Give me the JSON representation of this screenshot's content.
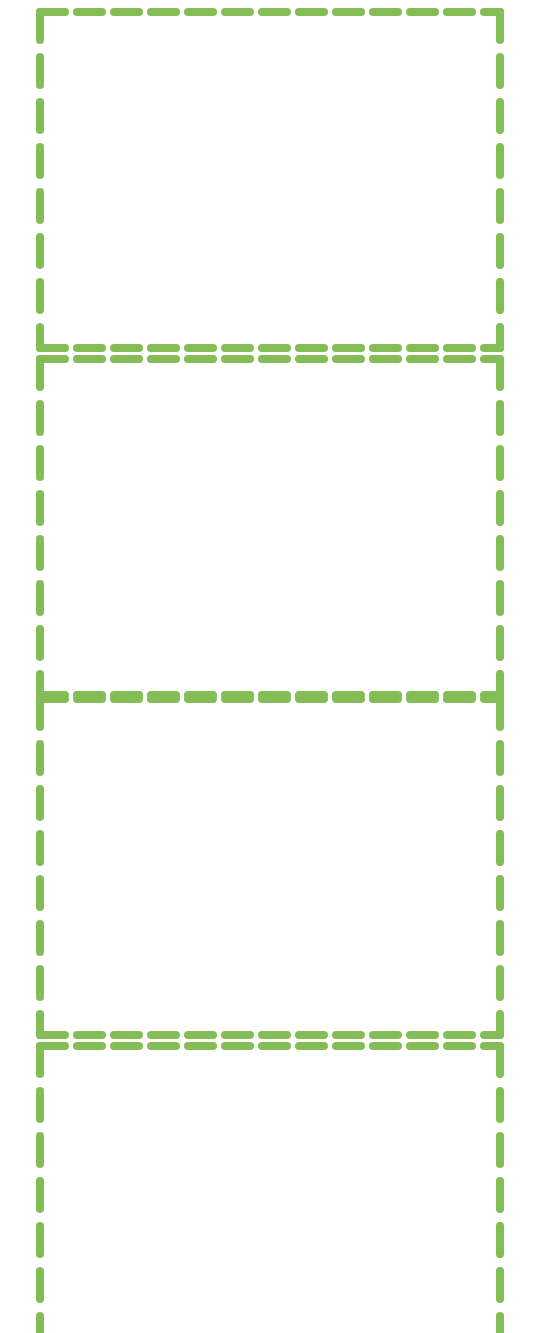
{
  "canvas": {
    "width": 544,
    "height": 1333,
    "background_color": "#ffffff",
    "label": "dashed-region-overlay"
  },
  "style": {
    "stroke_color": "#84bd55",
    "stroke_color_alt": "#7cb342",
    "stroke_width": 8,
    "dash_length_horizontal": 25,
    "dash_gap_horizontal": 12,
    "dash_length_vertical": 28,
    "dash_gap_vertical": 17,
    "line_cap": "round"
  },
  "regions": [
    {
      "id": "region-1",
      "name": "region-box-1",
      "x": 40,
      "y": 12,
      "width": 460,
      "height": 336,
      "clipped_top": false,
      "clipped_bottom": false
    },
    {
      "id": "region-2",
      "name": "region-box-2",
      "x": 40,
      "y": 359,
      "width": 460,
      "height": 336,
      "clipped_top": false,
      "clipped_bottom": false
    },
    {
      "id": "region-3",
      "name": "region-box-3",
      "x": 40,
      "y": 699,
      "width": 460,
      "height": 336,
      "clipped_top": false,
      "clipped_bottom": false
    },
    {
      "id": "region-4",
      "name": "region-box-4",
      "x": 40,
      "y": 1046,
      "width": 460,
      "height": 336,
      "clipped_top": false,
      "clipped_bottom": true
    }
  ]
}
